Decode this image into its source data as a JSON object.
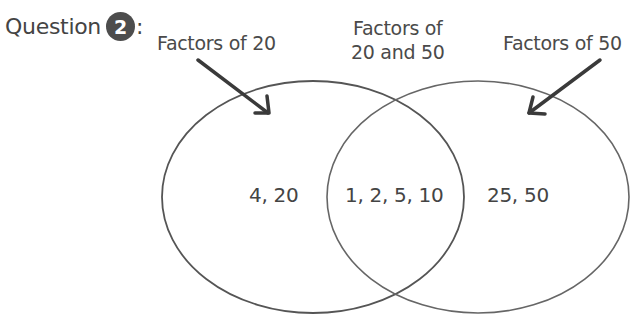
{
  "question": {
    "label": "Question",
    "number": "2",
    "colon": ":"
  },
  "labels": {
    "left": "Factors of 20",
    "middle_line1": "Factors of",
    "middle_line2": "20 and 50",
    "right": "Factors of 50"
  },
  "regions": {
    "only_20": "4, 20",
    "both": "1, 2, 5, 10",
    "only_50": "25, 50"
  },
  "colors": {
    "text": "#4a4a4a",
    "badge_bg": "#4d4d4d",
    "circle_stroke": "#5a5a5a",
    "arrow": "#3c3c3c"
  }
}
